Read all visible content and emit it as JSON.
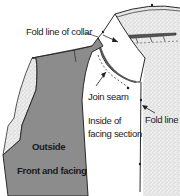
{
  "diagram": {
    "labels": {
      "fold_line_collar": "Fold line of collar",
      "join_seam": "Join seam",
      "inside_facing_line1": "Inside of",
      "inside_facing_line2": "facing section",
      "fold_line": "Fold line",
      "outside": "Outside",
      "front_facing": "Front and facing"
    },
    "colors": {
      "fabric_outside": "#8c8c8c",
      "fabric_inside_stipple": "#e4e4e4",
      "outline": "#2a2a2a",
      "background": "#ffffff"
    }
  }
}
